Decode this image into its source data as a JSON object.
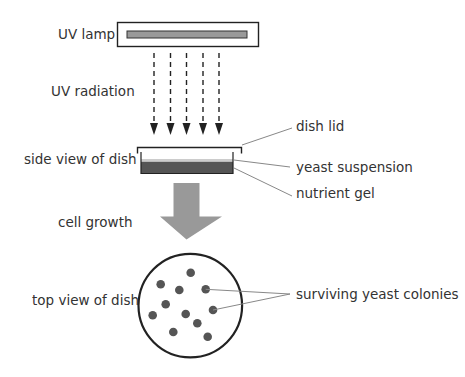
{
  "labels": {
    "uv_lamp": "UV lamp",
    "uv_radiation": "UV radiation",
    "side_view": "side view of dish",
    "dish_lid": "dish lid",
    "yeast_suspension": "yeast suspension",
    "nutrient_gel": "nutrient gel",
    "cell_growth": "cell growth",
    "top_view": "top view of dish",
    "surviving_colonies": "surviving yeast colonies"
  },
  "colors": {
    "text": "#333333",
    "outline": "#222222",
    "lamp_bar": "#999999",
    "gel": "#555555",
    "suspension": "#cccccc",
    "growth_arrow": "#999999",
    "colony": "#555555",
    "leader_line": "#888888"
  },
  "uv_rays": {
    "count": 5
  },
  "colonies": {
    "count": 11
  }
}
